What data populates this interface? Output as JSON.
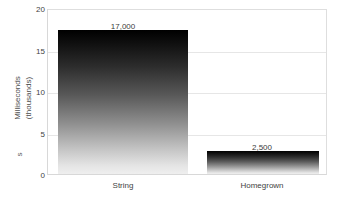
{
  "chart_data": {
    "type": "bar",
    "title": "",
    "xlabel": "",
    "ylabel": "Milliseconds (thousands)",
    "ylabel_line1": "Milliseconds",
    "ylabel_line2": "(thousands)",
    "ylabel_extra": "s",
    "categories": [
      "String",
      "Homegrown"
    ],
    "values": [
      17.3,
      2.8
    ],
    "data_labels": [
      "17,000",
      "2,500"
    ],
    "ylim": [
      0,
      20
    ],
    "yticks": [
      0,
      5,
      10,
      15,
      20
    ],
    "ytick_labels": [
      "0",
      "5",
      "10",
      "15",
      "20"
    ],
    "grid": true,
    "gridlines_at": [
      5,
      10,
      15
    ],
    "legend": "none",
    "series": [
      {
        "name": "Milliseconds (thousands)",
        "values": [
          17.3,
          2.8
        ]
      }
    ]
  },
  "style": {
    "bar_gradient_top": "#000000",
    "bar_gradient_bottom": "#efefef",
    "gridline_color": "#e6e6e6",
    "plot_border_color": "#d8d8d8",
    "text_color": "#3f3f3f",
    "background": "#ffffff"
  }
}
